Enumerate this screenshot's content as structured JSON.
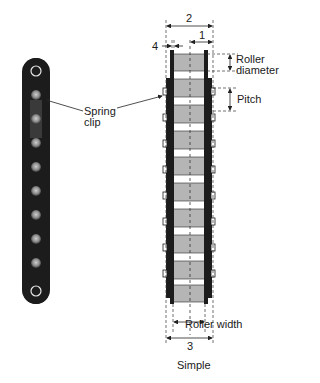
{
  "labels": {
    "spring_clip_line1": "Spring",
    "spring_clip_line2": "clip",
    "dim_1": "1",
    "dim_2": "2",
    "dim_3": "3",
    "dim_4": "4",
    "roller_diameter_line1": "Roller",
    "roller_diameter_line2": "diameter",
    "pitch": "Pitch",
    "roller_width": "Roller width",
    "caption": "Simple"
  },
  "colors": {
    "chain_dark": "#1c1c1c",
    "roller_gray": "#b5b5b5",
    "pin_light": "#9a9a9a",
    "line": "#222222"
  }
}
